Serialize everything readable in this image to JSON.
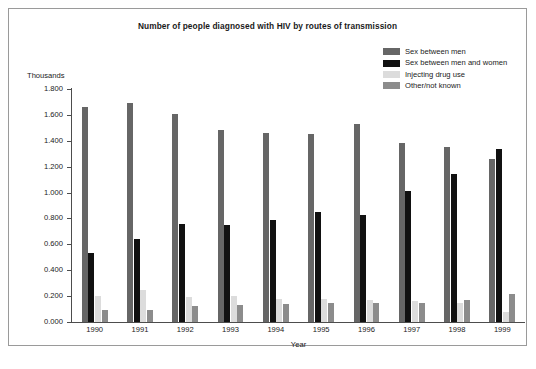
{
  "chart_data": {
    "type": "bar",
    "title": "Number of people diagnosed with HIV by routes of transmission",
    "xlabel": "Year",
    "ylabel": "Thousands",
    "categories": [
      "1990",
      "1991",
      "1992",
      "1993",
      "1994",
      "1995",
      "1996",
      "1997",
      "1998",
      "1999"
    ],
    "ylim": [
      0,
      1.8
    ],
    "ytick_labels": [
      "1.800",
      "1.600",
      "1.400",
      "1.200",
      "1.000",
      "0.800",
      "0.600",
      "0.400",
      "0.200",
      "0.000"
    ],
    "ytick_values": [
      1.8,
      1.6,
      1.4,
      1.2,
      1.0,
      0.8,
      0.6,
      0.4,
      0.2,
      0.0
    ],
    "grid": false,
    "legend_position": "top-right",
    "series": [
      {
        "name": "Sex between men",
        "color": "#666666",
        "values": [
          1.66,
          1.69,
          1.61,
          1.48,
          1.46,
          1.45,
          1.53,
          1.38,
          1.35,
          1.26
        ]
      },
      {
        "name": "Sex between men and women",
        "color": "#111111",
        "values": [
          0.53,
          0.64,
          0.76,
          0.75,
          0.79,
          0.85,
          0.83,
          1.01,
          1.14,
          1.34
        ]
      },
      {
        "name": "Injecting drug use",
        "color": "#dcdcdc",
        "values": [
          0.2,
          0.25,
          0.19,
          0.2,
          0.18,
          0.18,
          0.17,
          0.16,
          0.15,
          0.08
        ]
      },
      {
        "name": "Other/not known",
        "color": "#8c8c8c",
        "values": [
          0.09,
          0.09,
          0.12,
          0.13,
          0.14,
          0.15,
          0.15,
          0.15,
          0.17,
          0.22
        ]
      }
    ]
  }
}
